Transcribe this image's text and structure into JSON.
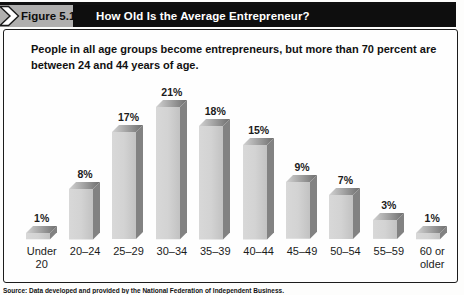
{
  "figure": {
    "label": "Figure 5.1",
    "title": "How Old Is the Average Entrepreneur?",
    "subtitle": "People in all age groups become entrepreneurs, but more than 70 percent are between 24 and 44 years of age.",
    "source": "Source: Data developed and provided by the National Federation of Independent Business."
  },
  "colors": {
    "header_bg": "#0e0e0e",
    "header_text": "#ffffff",
    "label_band_bg": "#b0afae",
    "box_border": "#1c1c1c",
    "bar_front_light": "#d8d8d8",
    "bar_front_dark": "#c2c2c2",
    "bar_side": "#828282",
    "bar_top_light": "#d2d2d2",
    "bar_top_dark": "#6e6e6e"
  },
  "chart_data": {
    "type": "bar",
    "title": "How Old Is the Average Entrepreneur?",
    "categories": [
      "Under 20",
      "20–24",
      "25–29",
      "30–34",
      "35–39",
      "40–44",
      "45–49",
      "50–54",
      "55–59",
      "60 or older"
    ],
    "values": [
      1,
      8,
      17,
      21,
      18,
      15,
      9,
      7,
      3,
      1
    ],
    "value_labels": [
      "1%",
      "8%",
      "17%",
      "21%",
      "18%",
      "15%",
      "9%",
      "7%",
      "3%",
      "1%"
    ],
    "unit": "%",
    "xlabel": "",
    "ylabel": "",
    "ylim": [
      0,
      22
    ],
    "grid": false,
    "legend": null,
    "style": "3d-gray-bars"
  }
}
